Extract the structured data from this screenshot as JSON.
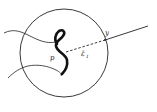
{
  "diagram": {
    "labels": {
      "point_p": "p",
      "point_y": "y",
      "segment_label": "ε̄",
      "segment_subscript": "1"
    },
    "colors": {
      "stroke": "#222222",
      "background": "#ffffff"
    },
    "elements": [
      "circle (ball) centered near p",
      "thick S-shaped curve through p",
      "two thin curves entering from left",
      "dashed segment from p to y on circle boundary",
      "solid ray from y extending outward"
    ]
  }
}
